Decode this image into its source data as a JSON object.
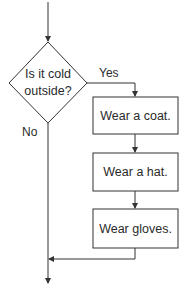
{
  "diagram": {
    "type": "flowchart",
    "decision": {
      "label_line1": "Is it cold",
      "label_line2": "outside?"
    },
    "branches": {
      "yes": "Yes",
      "no": "No"
    },
    "steps": [
      {
        "label": "Wear a coat."
      },
      {
        "label": "Wear a hat."
      },
      {
        "label": "Wear gloves."
      }
    ],
    "colors": {
      "line": "#333333",
      "fill": "#ffffff",
      "text": "#2a2a2a"
    }
  }
}
